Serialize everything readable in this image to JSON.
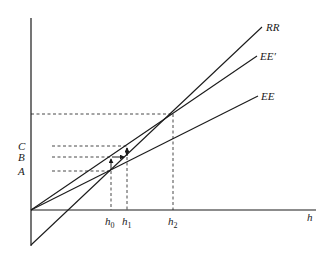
{
  "diagram": {
    "type": "economic-diagram",
    "axes": {
      "x_label": "h",
      "y_label": ""
    },
    "curves": [
      {
        "id": "RR",
        "label": "RR"
      },
      {
        "id": "EE_prime",
        "label": "EE′"
      },
      {
        "id": "EE",
        "label": "EE"
      }
    ],
    "x_ticks": [
      {
        "id": "h0",
        "base": "h",
        "sub": "0"
      },
      {
        "id": "h1",
        "base": "h",
        "sub": "1"
      },
      {
        "id": "h2",
        "base": "h",
        "sub": "2"
      }
    ],
    "y_ticks": [
      {
        "id": "C",
        "label": "C"
      },
      {
        "id": "B",
        "label": "B"
      },
      {
        "id": "A",
        "label": "A"
      }
    ],
    "colors": {
      "ink": "#1a1a1a",
      "background": "#ffffff"
    }
  }
}
